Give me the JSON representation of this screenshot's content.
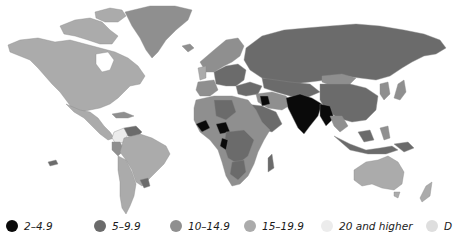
{
  "map": {
    "type": "choropleth world map",
    "grayscale": true,
    "colors": {
      "2-4.9": "#0a0a0a",
      "5-9.9": "#6b6b6b",
      "10-14.9": "#8f8f8f",
      "15-19.9": "#ababab",
      "20_and_higher": "#ececec",
      "no_data": "#dedede",
      "ocean": "#ffffff"
    }
  },
  "legend": {
    "items": [
      {
        "label": "2–4.9",
        "color": "#0a0a0a"
      },
      {
        "label": "5–9.9",
        "color": "#6b6b6b"
      },
      {
        "label": "10–14.9",
        "color": "#8f8f8f"
      },
      {
        "label": "15–19.9",
        "color": "#ababab"
      },
      {
        "label": "20 and higher",
        "color": "#ececec"
      },
      {
        "label": "D",
        "color": "#dedede"
      }
    ]
  }
}
